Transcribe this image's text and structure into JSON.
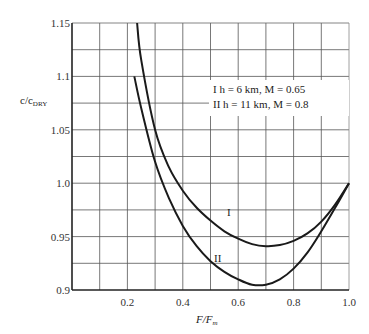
{
  "chart_data": {
    "type": "line",
    "title": "",
    "xlabel": "F/F_m",
    "ylabel": "c/c_DRY",
    "xlim": [
      0.0,
      1.0
    ],
    "ylim": [
      0.9,
      1.15
    ],
    "grid": true,
    "x_ticks": [
      "0.2",
      "0.4",
      "0.6",
      "0.8",
      "1.0"
    ],
    "y_ticks": [
      "0.9",
      "0.95",
      "1.0",
      "1.05",
      "1.1",
      "1.15"
    ],
    "legend": {
      "position": "upper right (inside plot)",
      "entries": [
        "I  h = 6 km, M = 0.65",
        "II  h = 11 km, M = 0.8"
      ]
    },
    "series": [
      {
        "name": "I",
        "description": "h = 6 km, M = 0.65",
        "x": [
          0.235,
          0.25,
          0.3,
          0.35,
          0.4,
          0.45,
          0.5,
          0.55,
          0.6,
          0.65,
          0.7,
          0.75,
          0.8,
          0.85,
          0.9,
          0.95,
          1.0
        ],
        "y": [
          1.15,
          1.115,
          1.05,
          1.015,
          0.993,
          0.977,
          0.965,
          0.955,
          0.948,
          0.943,
          0.941,
          0.942,
          0.946,
          0.953,
          0.964,
          0.98,
          1.0
        ]
      },
      {
        "name": "II",
        "description": "h = 11 km, M = 0.8",
        "x": [
          0.225,
          0.25,
          0.3,
          0.35,
          0.4,
          0.45,
          0.5,
          0.55,
          0.6,
          0.65,
          0.7,
          0.75,
          0.8,
          0.85,
          0.9,
          0.95,
          1.0
        ],
        "y": [
          1.1,
          1.07,
          1.02,
          0.986,
          0.96,
          0.941,
          0.927,
          0.917,
          0.91,
          0.905,
          0.905,
          0.91,
          0.92,
          0.935,
          0.955,
          0.977,
          1.0
        ]
      }
    ]
  },
  "axes": {
    "ylabel_main": "c/c",
    "ylabel_sub": "DRY",
    "xlabel_main": "F/F",
    "xlabel_sub": "m"
  },
  "legend": {
    "line1": "I  h = 6 km, M = 0.65",
    "line2": "II  h = 11 km, M = 0.8"
  },
  "curve_labels": {
    "I": "I",
    "II": "II"
  }
}
